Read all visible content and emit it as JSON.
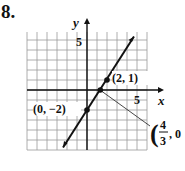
{
  "problem": {
    "number": "8."
  },
  "chart_data": {
    "type": "line",
    "title": "",
    "xlabel": "x",
    "ylabel": "y",
    "xlim": [
      -6,
      6
    ],
    "ylim": [
      -6,
      6
    ],
    "grid": true,
    "tick_labels": {
      "x": "5",
      "y": "5"
    },
    "series": [
      {
        "name": "line",
        "equation": "y = (3/2)x - 2",
        "x": [
          -2.5,
          5
        ],
        "y": [
          -5.75,
          5.5
        ]
      }
    ],
    "points": [
      {
        "label": "(2, 1)",
        "x": 2,
        "y": 1
      },
      {
        "label": "(0, −2)",
        "x": 0,
        "y": -2
      },
      {
        "label": "(4/3, 0)",
        "x": 1.3333,
        "y": 0
      }
    ],
    "annotations": {
      "p1": "(2, 1)",
      "p2": "(0, −2)",
      "p3_open": "(",
      "p3_num": "4",
      "p3_den": "3",
      "p3_rest": ", 0"
    }
  }
}
